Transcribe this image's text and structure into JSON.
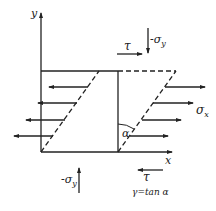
{
  "diagram": {
    "type": "shear-strain-element",
    "axes": {
      "x_label": "x",
      "y_label": "y"
    },
    "labels": {
      "shear_top": "τ",
      "shear_bottom": "τ",
      "normal_y_top": "-σ",
      "normal_y_top_sub": "y",
      "normal_y_bottom": "-σ",
      "normal_y_bottom_sub": "y",
      "normal_x": "σ",
      "normal_x_sub": "x",
      "angle": "α",
      "formula": "γ=tan α"
    },
    "colors": {
      "line": "#222222",
      "background": "#ffffff"
    }
  }
}
